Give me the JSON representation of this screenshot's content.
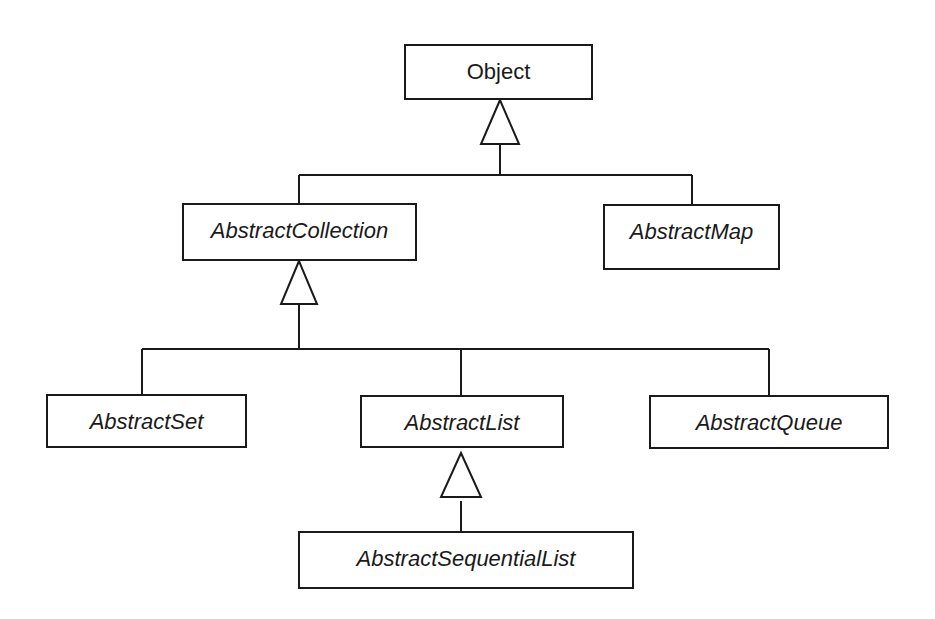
{
  "diagram": {
    "type": "UML class inheritance diagram",
    "classes": {
      "object": {
        "name": "Object",
        "abstract": false
      },
      "abstract_collection": {
        "name": "AbstractCollection",
        "abstract": true,
        "parent": "Object"
      },
      "abstract_map": {
        "name": "AbstractMap",
        "abstract": true,
        "parent": "Object"
      },
      "abstract_set": {
        "name": "AbstractSet",
        "abstract": true,
        "parent": "AbstractCollection"
      },
      "abstract_list": {
        "name": "AbstractList",
        "abstract": true,
        "parent": "AbstractCollection"
      },
      "abstract_queue": {
        "name": "AbstractQueue",
        "abstract": true,
        "parent": "AbstractCollection"
      },
      "abstract_sequential_list": {
        "name": "AbstractSequentialList",
        "abstract": true,
        "parent": "AbstractList"
      }
    },
    "edge_style": {
      "stroke": "#1a1a1a",
      "arrowhead": "hollow-triangle (generalization)"
    }
  }
}
